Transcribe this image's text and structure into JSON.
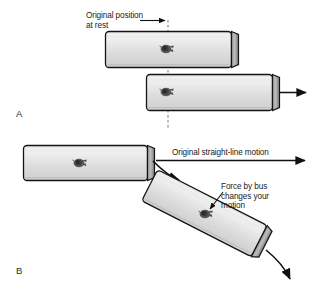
{
  "figure": {
    "background_color": "#ffffff",
    "width": 312,
    "height": 289
  },
  "panels": [
    {
      "id": "A",
      "letter": "A",
      "description": "Bus accelerates forward from rest; passenger stays at original position"
    },
    {
      "id": "B",
      "letter": "B",
      "description": "Bus turns; passenger continues in original straight-line motion until force from bus changes it"
    }
  ],
  "labels": {
    "original_position_line1": "Original position",
    "original_position_line2": "at rest",
    "straight_line_motion": "Original straight-line motion",
    "force_line1": "Force by bus",
    "force_line2": "changes your",
    "force_line3": "motion"
  },
  "colors": {
    "bus_body": "#d9d9d9",
    "bus_body_highlight": "#eaeaea",
    "bus_endcap": "#8c8c8c",
    "bus_outline": "#1a1a1a",
    "passenger": "#4a4a4a",
    "arrow": "#111111",
    "dashed_line": "#6e6e6e",
    "text": "#1a1a1a"
  },
  "elements": {
    "dashed_reference_line": {
      "name": "original-position-dashed-line",
      "x": 168,
      "y_start": 20,
      "y_end": 128,
      "style": "dashed"
    },
    "buses": [
      {
        "name": "bus-a-top",
        "panel": "A",
        "x": 105,
        "y": 31,
        "width": 133,
        "height": 37,
        "rotation_deg": 0,
        "passenger_x": 166,
        "passenger_y": 48
      },
      {
        "name": "bus-a-bottom",
        "panel": "A",
        "x": 146,
        "y": 74,
        "width": 133,
        "height": 37,
        "rotation_deg": 0,
        "passenger_x": 166,
        "passenger_y": 92
      },
      {
        "name": "bus-b-straight",
        "panel": "B",
        "x": 23,
        "y": 145,
        "width": 130,
        "height": 36,
        "rotation_deg": 0,
        "passenger_x": 78,
        "passenger_y": 162
      },
      {
        "name": "bus-b-turned",
        "panel": "B",
        "x": 140,
        "y": 196,
        "width": 136,
        "height": 38,
        "rotation_deg": 27,
        "passenger_x": 204,
        "passenger_y": 216
      }
    ],
    "arrows": [
      {
        "name": "pointer-arrow-original-position",
        "type": "straight",
        "from": [
          139,
          20
        ],
        "to": [
          167,
          20
        ]
      },
      {
        "name": "motion-arrow-bus-a",
        "type": "straight",
        "from": [
          281,
          93
        ],
        "to": [
          307,
          93
        ]
      },
      {
        "name": "straight-line-motion-arrow",
        "type": "straight",
        "from": [
          155,
          160
        ],
        "to": [
          305,
          160
        ]
      },
      {
        "name": "curved-turn-arrow-top",
        "type": "curved",
        "from": [
          152,
          160
        ],
        "to": [
          182,
          180
        ]
      },
      {
        "name": "curved-turn-arrow-bottom",
        "type": "curved",
        "from": [
          268,
          252
        ],
        "to": [
          292,
          281
        ]
      },
      {
        "name": "pointer-arrow-force",
        "type": "straight",
        "from": [
          222,
          193
        ],
        "to": [
          208,
          211
        ]
      }
    ]
  }
}
